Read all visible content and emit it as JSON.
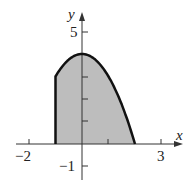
{
  "chart_data": {
    "type": "area",
    "title": "",
    "function": "y = 4 - x^2",
    "domain": [
      -1,
      2
    ],
    "x": [
      -1,
      -0.5,
      0,
      0.5,
      1,
      1.5,
      2
    ],
    "values": [
      3,
      3.75,
      4,
      3.75,
      3,
      1.75,
      0
    ],
    "xlabel": "x",
    "ylabel": "y",
    "xlim": [
      -2.3,
      3.6
    ],
    "ylim": [
      -1.7,
      5.8
    ],
    "x_tick_labels": [
      "-2",
      "3"
    ],
    "y_tick_labels": [
      "5",
      "-1"
    ],
    "x_ticks": [
      -2,
      1,
      3
    ],
    "y_ticks": [
      -1,
      1,
      2,
      3,
      5
    ],
    "shaded_region": "between curve and x-axis from x=-1 to x=2",
    "colors": {
      "fill": "#bdbdbd",
      "curve": "#111111",
      "axis": "#333333"
    }
  },
  "labels": {
    "x_axis": "x",
    "y_axis": "y",
    "x_neg2": "−2",
    "x_3": "3",
    "y_5": "5",
    "y_neg1": "−1"
  }
}
